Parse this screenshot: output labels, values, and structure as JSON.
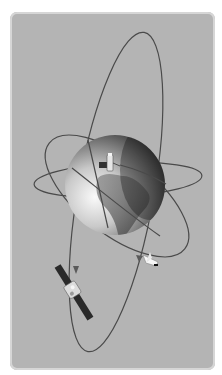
{
  "scene": {
    "description": "Grayscale illustration of Earth with orbiting satellites and a space shuttle",
    "colors": {
      "background": "#ffffff",
      "panel": "#b4b4b4",
      "panel_border": "#d6d6d6",
      "orbit_line": "#4a4a4a",
      "globe_light": "#f2f2f2",
      "globe_dark": "#1a1a1a",
      "continent": "#6e6e6e"
    },
    "objects": [
      {
        "name": "earth-globe",
        "center": [
          115,
          185
        ],
        "radius": 50
      },
      {
        "name": "orbit-polar",
        "type": "ellipse"
      },
      {
        "name": "orbit-inclined",
        "type": "ellipse"
      },
      {
        "name": "orbit-equatorial",
        "type": "ellipse"
      },
      {
        "name": "satellite-on-globe",
        "position": [
          110,
          160
        ]
      },
      {
        "name": "satellite-solar-panels",
        "position": [
          72,
          290
        ]
      },
      {
        "name": "space-shuttle",
        "position": [
          150,
          262
        ]
      }
    ]
  }
}
